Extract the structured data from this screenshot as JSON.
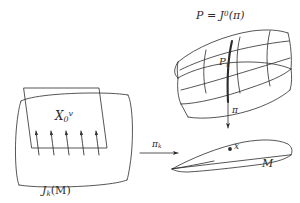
{
  "figure": {
    "background_color": "#ffffff",
    "ink_color": "#2b2b2b",
    "width": 300,
    "height": 203
  },
  "left_panel": {
    "name": "jet-space-panel",
    "field_label_base": "X",
    "field_label_sub": "0",
    "field_label_sup": "v",
    "base_label_text": "J",
    "base_label_sub": "k",
    "base_label_paren": "(M)",
    "vertical_arrow_count": 5,
    "description": "vertical vector field on jet space"
  },
  "projection_arrow": {
    "name": "pi-k-arrow",
    "label_base": "π",
    "label_sub": "k",
    "direction": "right"
  },
  "top_right_panel": {
    "name": "total-space-panel",
    "title_text": "P = J",
    "title_sup": "0",
    "title_tail": "(π)",
    "fiber_label_base": "P",
    "fiber_label_sub": "x",
    "description": "total space P drawn as curved fibre bundle with highlighted fibre"
  },
  "vertical_projection": {
    "name": "pi-arrow",
    "label": "π",
    "direction": "down"
  },
  "bottom_right_panel": {
    "name": "base-manifold-panel",
    "point_label": "x",
    "manifold_label": "M",
    "description": "base manifold M with marked point x"
  }
}
